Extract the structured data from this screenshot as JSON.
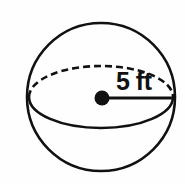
{
  "figure": {
    "shape_name": "sphere",
    "label": "5 ft",
    "measurement": {
      "value": 5,
      "unit": "ft",
      "quantity": "radius"
    },
    "colors": {
      "stroke": "#111111",
      "background": "#fefefe",
      "center_dot": "#111111"
    },
    "geometry": {
      "outline_circle": {
        "cx": 101,
        "cy": 97,
        "r": 74
      },
      "equator_ellipse": {
        "cx": 101,
        "cy": 97,
        "rx": 72,
        "ry": 31
      },
      "center_dot": {
        "cx": 102,
        "cy": 98,
        "r": 7
      },
      "radius_line": {
        "x1": 102,
        "y1": 98,
        "x2": 175,
        "y2": 98
      },
      "back_arc_style": "dashed",
      "front_arc_style": "solid",
      "dash_pattern": "7 4",
      "stroke_width": 2.6
    },
    "label_position": {
      "x": 116,
      "y": 90
    }
  }
}
